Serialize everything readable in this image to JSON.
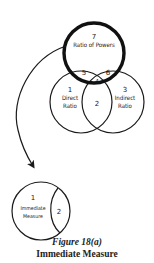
{
  "figure": {
    "title": "Figure 18(a)",
    "subtitle": "Immediate Measure"
  },
  "top_group": {
    "ratio_of_powers": {
      "number": "7",
      "label": "Ratio of Powers"
    },
    "direct_ratio": {
      "number": "1",
      "label_line1": "Direct",
      "label_line2": "Ratio"
    },
    "indirect_ratio": {
      "number": "3",
      "label_line1": "Indirect",
      "label_line2": "Ratio"
    },
    "overlap_2": "2",
    "overlap_4": "4",
    "overlap_5": "5",
    "overlap_6": "6"
  },
  "bottom_group": {
    "immediate_measure": {
      "number": "1",
      "label_line1": "Immediate",
      "label_line2": "Measure"
    },
    "overlap_2": "2"
  },
  "colors": {
    "stroke": "#1a1a1a",
    "background": "#ffffff"
  }
}
